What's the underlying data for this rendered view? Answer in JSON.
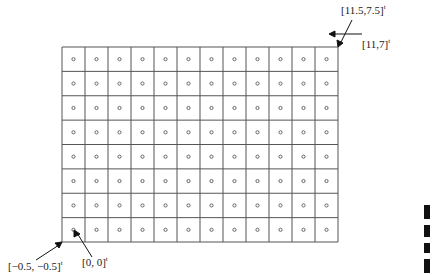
{
  "diagram": {
    "grid": {
      "cols": 12,
      "rows": 8,
      "left": 62,
      "top": 47,
      "right": 338,
      "bottom": 242,
      "line_color": "#555555",
      "dot_color": "#666666"
    },
    "annotations": {
      "top_right_corner": {
        "text": "[11.5,7.5]",
        "sup": "t"
      },
      "top_right_center": {
        "text": "[11,7]",
        "sup": "t"
      },
      "bottom_left_corner": {
        "text": "[−0.5, −0.5]",
        "sup": "t"
      },
      "bottom_left_center": {
        "text": "[0, 0]",
        "sup": "t"
      }
    }
  }
}
